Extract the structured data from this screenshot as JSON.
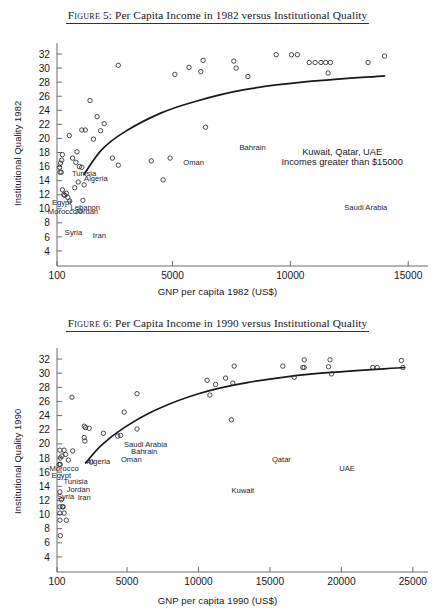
{
  "page": {
    "background": "#ffffff",
    "width": 435,
    "height": 615
  },
  "figures": [
    {
      "id": "figure-5",
      "title_prefix": "Figure",
      "title_number": "5:",
      "title_text": "Per Capita Income in 1982 versus Institutional Quality",
      "title_full": "Figure 5:  Per Capita Income in 1982 versus Institutional Quality"
    },
    {
      "id": "figure-6",
      "title_prefix": "Figure",
      "title_number": "6:",
      "title_text": "Per Capita Income in 1990 versus Institutional Quality",
      "title_full": "Figure 6:  Per Capita Income in 1990 versus Institutional Quality"
    }
  ],
  "chart_data": [
    {
      "type": "scatter",
      "title": "Figure 5: Per Capita Income in 1982 versus Institutional Quality",
      "xlabel": "GNP per capita 1982 (US$)",
      "ylabel": "Institutional Quality 1982",
      "xlim": [
        100,
        15500
      ],
      "ylim": [
        3,
        33
      ],
      "xticks": [
        100,
        5000,
        10000,
        15000
      ],
      "xticklabels": [
        "100",
        "5000",
        "10000",
        "15000"
      ],
      "yticks": [
        4,
        6,
        8,
        10,
        12,
        14,
        16,
        18,
        20,
        22,
        24,
        26,
        28,
        30,
        32
      ],
      "yticklabels": [
        "4",
        "6",
        "8",
        "10",
        "12",
        "14",
        "16",
        "18",
        "20",
        "22",
        "24",
        "26",
        "28",
        "30",
        "32"
      ],
      "grid": false,
      "legend": false,
      "marker": "open-circle",
      "points": [
        {
          "x": 330,
          "y": 17.7
        },
        {
          "x": 300,
          "y": 16.9
        },
        {
          "x": 250,
          "y": 16.5
        },
        {
          "x": 210,
          "y": 15.9
        },
        {
          "x": 230,
          "y": 15.2
        },
        {
          "x": 280,
          "y": 15.2
        },
        {
          "x": 620,
          "y": 20.4
        },
        {
          "x": 760,
          "y": 17.2
        },
        {
          "x": 900,
          "y": 16.6
        },
        {
          "x": 950,
          "y": 18.1
        },
        {
          "x": 1050,
          "y": 16.0
        },
        {
          "x": 1150,
          "y": 15.9
        },
        {
          "x": 1300,
          "y": 21.2
        },
        {
          "x": 1150,
          "y": 21.2
        },
        {
          "x": 1500,
          "y": 25.4
        },
        {
          "x": 1650,
          "y": 19.9
        },
        {
          "x": 1800,
          "y": 23.1
        },
        {
          "x": 1950,
          "y": 21.1
        },
        {
          "x": 2100,
          "y": 22.1
        },
        {
          "x": 2700,
          "y": 30.4
        },
        {
          "x": 2450,
          "y": 17.2
        },
        {
          "x": 2700,
          "y": 16.2
        },
        {
          "x": 4100,
          "y": 16.8
        },
        {
          "x": 4900,
          "y": 17.2
        },
        {
          "x": 4600,
          "y": 14.1
        },
        {
          "x": 5100,
          "y": 29.1
        },
        {
          "x": 5700,
          "y": 30.1
        },
        {
          "x": 6200,
          "y": 29.5
        },
        {
          "x": 6300,
          "y": 31.1
        },
        {
          "x": 6400,
          "y": 21.6
        },
        {
          "x": 7600,
          "y": 31.0
        },
        {
          "x": 7700,
          "y": 30.0
        },
        {
          "x": 9400,
          "y": 31.9
        },
        {
          "x": 10050,
          "y": 31.9
        },
        {
          "x": 10300,
          "y": 31.9
        },
        {
          "x": 10800,
          "y": 30.8
        },
        {
          "x": 11050,
          "y": 30.8
        },
        {
          "x": 11300,
          "y": 30.8
        },
        {
          "x": 11500,
          "y": 30.8
        },
        {
          "x": 11700,
          "y": 30.8
        },
        {
          "x": 11600,
          "y": 29.3
        },
        {
          "x": 8200,
          "y": 28.8
        },
        {
          "x": 13300,
          "y": 30.8
        },
        {
          "x": 14000,
          "y": 31.7
        },
        {
          "x": 330,
          "y": 12.7
        },
        {
          "x": 390,
          "y": 12.0
        },
        {
          "x": 430,
          "y": 11.9
        },
        {
          "x": 500,
          "y": 12.2
        },
        {
          "x": 560,
          "y": 11.6
        },
        {
          "x": 640,
          "y": 11.1
        },
        {
          "x": 1200,
          "y": 11.2
        },
        {
          "x": 1080,
          "y": 9.7
        },
        {
          "x": 1250,
          "y": 13.4
        },
        {
          "x": 1000,
          "y": 13.8
        },
        {
          "x": 850,
          "y": 13.0
        }
      ],
      "fit_line": [
        {
          "x": 1250,
          "y": 14.9
        },
        {
          "x": 2000,
          "y": 18.4
        },
        {
          "x": 3000,
          "y": 21.0
        },
        {
          "x": 4500,
          "y": 23.6
        },
        {
          "x": 6000,
          "y": 25.3
        },
        {
          "x": 8000,
          "y": 26.9
        },
        {
          "x": 10500,
          "y": 28.0
        },
        {
          "x": 14000,
          "y": 28.9
        }
      ],
      "point_labels": [
        {
          "text": "Tunisia",
          "x": 1250,
          "y": 14.6
        },
        {
          "text": "Algeria",
          "x": 1750,
          "y": 13.9
        },
        {
          "text": "Egypt",
          "x": 300,
          "y": 10.6
        },
        {
          "text": "Lebanon",
          "x": 1300,
          "y": 9.9
        },
        {
          "text": "Morocco",
          "x": 330,
          "y": 9.3
        },
        {
          "text": "Jordan",
          "x": 1350,
          "y": 9.2
        },
        {
          "text": "Syria",
          "x": 800,
          "y": 6.3
        },
        {
          "text": "Iran",
          "x": 1900,
          "y": 5.8
        },
        {
          "text": "Oman",
          "x": 5900,
          "y": 16.3
        },
        {
          "text": "Bahrain",
          "x": 8400,
          "y": 18.4
        },
        {
          "text": "Saudi Arabia",
          "x": 13200,
          "y": 9.8
        }
      ],
      "annotations": [
        {
          "text": "Kuwait, Qatar, UAE",
          "x": 12200,
          "y": 17.7
        },
        {
          "text": "Incomes greater than $15000",
          "x": 12200,
          "y": 16.3
        }
      ]
    },
    {
      "type": "scatter",
      "title": "Figure 6: Per Capita Income in 1990 versus Institutional Quality",
      "xlabel": "GNP per capita 1990 (US$)",
      "ylabel": "Institutional Quality 1990",
      "xlim": [
        100,
        25500
      ],
      "ylim": [
        3,
        33
      ],
      "xticks": [
        100,
        5000,
        10000,
        15000,
        20000,
        25000
      ],
      "xticklabels": [
        "100",
        "5000",
        "10000",
        "15000",
        "20000",
        "25000"
      ],
      "yticks": [
        4,
        6,
        8,
        10,
        12,
        14,
        16,
        18,
        20,
        22,
        24,
        26,
        28,
        30,
        32
      ],
      "yticklabels": [
        "4",
        "6",
        "8",
        "10",
        "12",
        "14",
        "16",
        "18",
        "20",
        "22",
        "24",
        "26",
        "28",
        "30",
        "32"
      ],
      "grid": false,
      "legend": false,
      "marker": "open-circle",
      "points": [
        {
          "x": 300,
          "y": 19.1
        },
        {
          "x": 600,
          "y": 19.1
        },
        {
          "x": 450,
          "y": 18.3
        },
        {
          "x": 330,
          "y": 18.0
        },
        {
          "x": 700,
          "y": 18.5
        },
        {
          "x": 900,
          "y": 17.7
        },
        {
          "x": 260,
          "y": 17.1
        },
        {
          "x": 330,
          "y": 17.1
        },
        {
          "x": 1200,
          "y": 19.0
        },
        {
          "x": 1150,
          "y": 26.6
        },
        {
          "x": 2000,
          "y": 22.5
        },
        {
          "x": 2100,
          "y": 22.3
        },
        {
          "x": 2350,
          "y": 22.2
        },
        {
          "x": 2000,
          "y": 20.9
        },
        {
          "x": 2050,
          "y": 20.4
        },
        {
          "x": 3350,
          "y": 21.5
        },
        {
          "x": 4350,
          "y": 21.1
        },
        {
          "x": 4800,
          "y": 24.5
        },
        {
          "x": 5700,
          "y": 27.1
        },
        {
          "x": 5700,
          "y": 22.1
        },
        {
          "x": 4550,
          "y": 21.2
        },
        {
          "x": 10600,
          "y": 29.0
        },
        {
          "x": 10800,
          "y": 26.9
        },
        {
          "x": 11200,
          "y": 28.4
        },
        {
          "x": 12500,
          "y": 31.0
        },
        {
          "x": 12300,
          "y": 23.4
        },
        {
          "x": 11900,
          "y": 29.3
        },
        {
          "x": 12400,
          "y": 28.6
        },
        {
          "x": 15900,
          "y": 31.0
        },
        {
          "x": 16700,
          "y": 29.4
        },
        {
          "x": 17400,
          "y": 31.9
        },
        {
          "x": 17300,
          "y": 30.8
        },
        {
          "x": 17400,
          "y": 30.8
        },
        {
          "x": 19200,
          "y": 31.9
        },
        {
          "x": 19100,
          "y": 30.9
        },
        {
          "x": 19300,
          "y": 29.9
        },
        {
          "x": 22200,
          "y": 30.8
        },
        {
          "x": 22500,
          "y": 30.8
        },
        {
          "x": 24200,
          "y": 31.8
        },
        {
          "x": 24300,
          "y": 30.8
        },
        {
          "x": 300,
          "y": 13.2
        },
        {
          "x": 400,
          "y": 12.1
        },
        {
          "x": 300,
          "y": 11.1
        },
        {
          "x": 480,
          "y": 11.1
        },
        {
          "x": 530,
          "y": 11.1
        },
        {
          "x": 300,
          "y": 10.2
        },
        {
          "x": 600,
          "y": 10.2
        },
        {
          "x": 300,
          "y": 9.2
        },
        {
          "x": 750,
          "y": 9.2
        },
        {
          "x": 330,
          "y": 7.0
        },
        {
          "x": 2500,
          "y": 17.4
        }
      ],
      "fit_line": [
        {
          "x": 2100,
          "y": 17.3
        },
        {
          "x": 3200,
          "y": 19.8
        },
        {
          "x": 4800,
          "y": 22.3
        },
        {
          "x": 7000,
          "y": 24.8
        },
        {
          "x": 10000,
          "y": 27.1
        },
        {
          "x": 13500,
          "y": 28.7
        },
        {
          "x": 18000,
          "y": 29.9
        },
        {
          "x": 24400,
          "y": 30.8
        }
      ],
      "point_labels": [
        {
          "text": "Saudi Arabia",
          "x": 6300,
          "y": 19.6
        },
        {
          "text": "Bahrain",
          "x": 6200,
          "y": 18.6
        },
        {
          "text": "Oman",
          "x": 5300,
          "y": 17.5
        },
        {
          "text": "Algeria",
          "x": 3000,
          "y": 17.1
        },
        {
          "text": "Morocco",
          "x": 600,
          "y": 16.2
        },
        {
          "text": "Egypt",
          "x": 400,
          "y": 15.2
        },
        {
          "text": "Tunisia",
          "x": 1400,
          "y": 14.3
        },
        {
          "text": "Jordan",
          "x": 1600,
          "y": 13.2
        },
        {
          "text": "Syria",
          "x": 700,
          "y": 12.2
        },
        {
          "text": "Iran",
          "x": 2000,
          "y": 12.0
        },
        {
          "text": "Qatar",
          "x": 15800,
          "y": 17.5
        },
        {
          "text": "UAE",
          "x": 20400,
          "y": 16.2
        },
        {
          "text": "Kuwait",
          "x": 13100,
          "y": 13.0
        }
      ],
      "annotations": []
    }
  ]
}
